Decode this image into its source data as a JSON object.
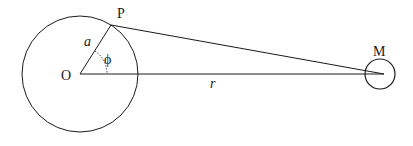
{
  "diagram": {
    "labels": {
      "origin": "O",
      "point": "P",
      "mass": "M",
      "radius_a": "a",
      "angle": "ϕ",
      "distance": "r"
    },
    "colors": {
      "stroke": "#1a1a1a",
      "background": "#ffffff"
    }
  }
}
